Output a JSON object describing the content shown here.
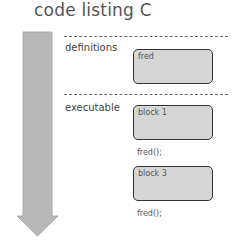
{
  "title": "code listing C",
  "sections": {
    "definitions": {
      "label": "definitions",
      "blocks": [
        {
          "label": "fred"
        }
      ]
    },
    "executable": {
      "label": "executable",
      "blocks": [
        {
          "label": "block 1"
        },
        {
          "label": "block 3"
        }
      ],
      "calls": [
        "fred();",
        "fred();"
      ]
    }
  },
  "colors": {
    "arrow_fill": "#b8b8b8",
    "arrow_stroke": "#a0a0a0",
    "box_fill": "#d6d6d6",
    "box_border": "#333333"
  }
}
